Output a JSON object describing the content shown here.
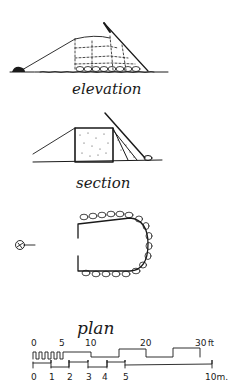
{
  "labels": {
    "elevation": "elevation",
    "section": "section",
    "plan": "plan"
  },
  "scale_bar": {
    "feet": {
      "ticks": [
        "0",
        "5",
        "10",
        "20",
        "30"
      ],
      "unit": "ft"
    },
    "meters": {
      "ticks": [
        "0",
        "1",
        "2",
        "3",
        "4",
        "5"
      ],
      "end_label": "10m."
    }
  },
  "icons": {
    "north_arrow": "north-arrow-icon"
  },
  "colors": {
    "ink": "#1a1a1a",
    "paper": "#ffffff"
  }
}
